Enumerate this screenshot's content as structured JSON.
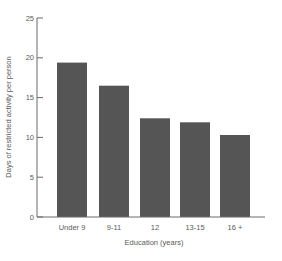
{
  "chart_data": {
    "type": "bar",
    "title": "",
    "xlabel": "Education (years)",
    "ylabel": "Days of restricted activity per person",
    "categories": [
      "Under 9",
      "9-11",
      "12",
      "13-15",
      "16 +"
    ],
    "values": [
      19.4,
      16.5,
      12.4,
      11.9,
      10.3
    ],
    "ylim": [
      0,
      25
    ],
    "yticks": [
      0,
      5,
      10,
      15,
      20,
      25
    ],
    "grid": false,
    "legend": null,
    "bar_color": "#555555"
  },
  "labels": {
    "xlabel": "Education (years)",
    "ylabel": "Days of restricted activity per person",
    "yticks": [
      "0",
      "5",
      "10",
      "15",
      "20",
      "25"
    ],
    "categories": [
      "Under 9",
      "9-11",
      "12",
      "13-15",
      "16 +"
    ]
  }
}
